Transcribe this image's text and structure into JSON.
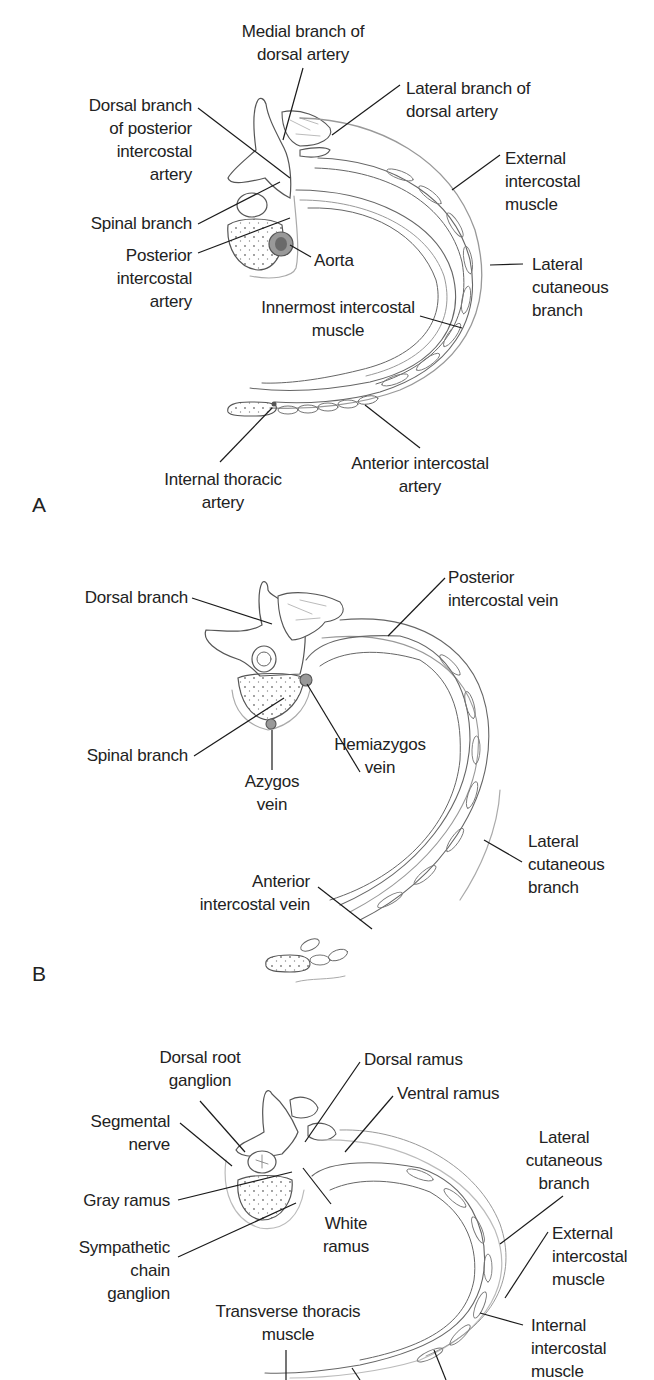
{
  "figure": {
    "panels": [
      {
        "letter": "A",
        "subject": "arteries",
        "labels": {
          "medial_branch": "Medial branch of\ndorsal artery",
          "lateral_branch": "Lateral branch of\ndorsal artery",
          "dorsal_branch": "Dorsal branch\nof posterior\nintercostal\nartery",
          "external_intercostal": "External\nintercostal\nmuscle",
          "spinal_branch": "Spinal branch",
          "posterior_intercostal": "Posterior\nintercostal\nartery",
          "aorta": "Aorta",
          "lateral_cutaneous": "Lateral\ncutaneous\nbranch",
          "innermost_intercostal": "Innermost intercostal\nmuscle",
          "internal_thoracic": "Internal thoracic\nartery",
          "anterior_intercostal": "Anterior intercostal\nartery"
        }
      },
      {
        "letter": "B",
        "subject": "veins",
        "labels": {
          "dorsal_branch": "Dorsal branch",
          "posterior_intercostal_vein": "Posterior\nintercostal vein",
          "spinal_branch": "Spinal branch",
          "hemiazygos": "Hemiazygos\nvein",
          "azygos": "Azygos\nvein",
          "lateral_cutaneous": "Lateral\ncutaneous\nbranch",
          "anterior_intercostal_vein": "Anterior\nintercostal vein"
        }
      },
      {
        "letter": "C",
        "subject": "nerves",
        "labels": {
          "dorsal_root_ganglion": "Dorsal root\nganglion",
          "dorsal_ramus": "Dorsal ramus",
          "ventral_ramus": "Ventral ramus",
          "segmental_nerve": "Segmental\nnerve",
          "lateral_cutaneous": "Lateral\ncutaneous\nbranch",
          "gray_ramus": "Gray ramus",
          "white_ramus": "White\nramus",
          "external_intercostal": "External\nintercostal\nmuscle",
          "sympathetic_chain": "Sympathetic\nchain\nganglion",
          "transverse_thoracis": "Transverse thoracis\nmuscle",
          "internal_intercostal": "Internal\nintercostal\nmuscle"
        }
      }
    ],
    "colors": {
      "text": "#222222",
      "leader": "#1a1a1a",
      "outline": "#555555",
      "light_outline": "#9a9a9a",
      "vessel_fill": "#8a8a8a"
    }
  }
}
